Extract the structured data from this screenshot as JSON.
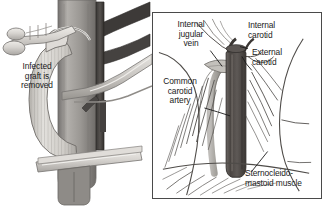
{
  "figure": {
    "type": "medical-illustration",
    "panel_count": 2,
    "background_color": "#ffffff",
    "ink_color": "#1a1a1a"
  },
  "left_panel": {
    "name": "graft-removal-view",
    "border": false,
    "labels": {
      "infected_graft": "Infected\ngraft is\nremoved"
    },
    "structures": [
      {
        "name": "corrugated-vascular-graft",
        "tone": "#d8d6d2",
        "description": "ribbed tube curving down and left"
      },
      {
        "name": "common-carotid-artery-trunk",
        "tone": "#9b9894"
      },
      {
        "name": "dark-jugular-vein-branch",
        "tone": "#4d4a47"
      },
      {
        "name": "upper-surgical-clamp",
        "tone": "#cfcdc9"
      },
      {
        "name": "right-surgical-retractor",
        "tone": "#cfcdc9"
      },
      {
        "name": "lower-surgical-clamp",
        "tone": "#cfcdc9"
      }
    ]
  },
  "right_panel": {
    "name": "neck-anatomy-view",
    "border": true,
    "border_color": "#4a4a4a",
    "labels": {
      "internal_jugular_vein": "Internal\njugular\nvein",
      "internal_carotid": "Internal\ncarotid",
      "external_carotid": "External\ncarotid",
      "common_carotid_artery": "Common\ncarotid\nartery",
      "sternocleidomastoid_muscle": "Sternocleido-\nmastoid muscle"
    },
    "structures": [
      {
        "name": "common-carotid-artery",
        "tone": "#5b5752",
        "description": "dark vertical vessel at center"
      },
      {
        "name": "internal-jugular-vein",
        "tone": "#8f8c88"
      },
      {
        "name": "sternocleidomastoid-muscle",
        "tone": "#7a7772",
        "description": "hatched diagonal fibers"
      },
      {
        "name": "mandible-outline",
        "tone": "#6e6b67"
      },
      {
        "name": "neck-contour-line",
        "tone": "#4a4a4a"
      }
    ]
  }
}
